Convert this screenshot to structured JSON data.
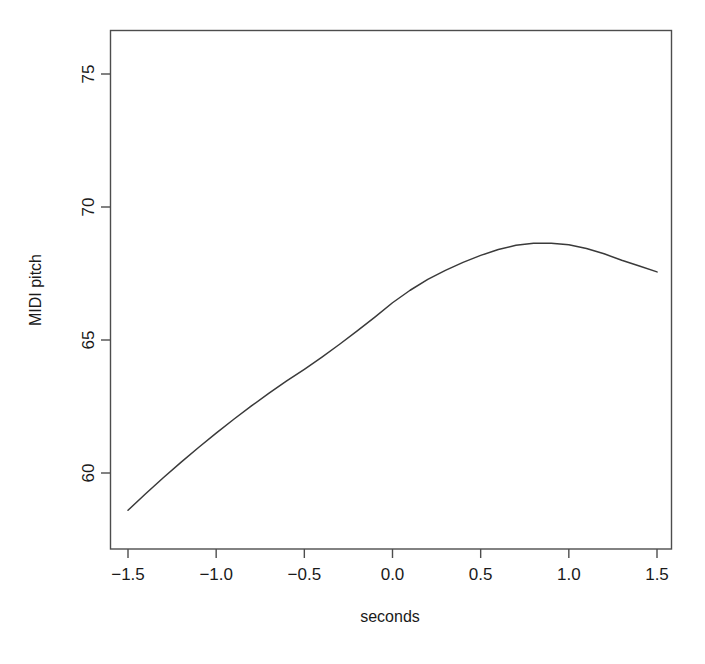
{
  "chart_data": {
    "type": "line",
    "title": "",
    "subtitle": "",
    "xlabel": "seconds",
    "ylabel": "MIDI pitch",
    "xlim": [
      -1.5,
      1.5
    ],
    "ylim": [
      57.6,
      76.4
    ],
    "grid": false,
    "legend": null,
    "legend_position": "none",
    "xticks": [
      -1.5,
      -1.0,
      -0.5,
      0.0,
      0.5,
      1.0,
      1.5
    ],
    "xtick_labels": [
      "-1.5",
      "-1.0",
      "-0.5",
      "0.0",
      "0.5",
      "1.0",
      "1.5"
    ],
    "yticks": [
      60,
      65,
      70,
      75
    ],
    "ytick_labels": [
      "60",
      "65",
      "70",
      "75"
    ],
    "series": [
      {
        "name": "smoothed pitch contour",
        "color": "#3a3a3a",
        "x": [
          -1.5,
          -1.4,
          -1.3,
          -1.2,
          -1.1,
          -1.0,
          -0.9,
          -0.8,
          -0.7,
          -0.6,
          -0.5,
          -0.4,
          -0.3,
          -0.2,
          -0.1,
          0.0,
          0.1,
          0.2,
          0.3,
          0.4,
          0.5,
          0.6,
          0.7,
          0.8,
          0.9,
          1.0,
          1.1,
          1.2,
          1.3,
          1.4,
          1.5
        ],
        "y": [
          58.6,
          59.22,
          59.82,
          60.4,
          60.96,
          61.5,
          62.02,
          62.52,
          63.0,
          63.46,
          63.9,
          64.36,
          64.84,
          65.34,
          65.86,
          66.4,
          66.87,
          67.28,
          67.62,
          67.92,
          68.18,
          68.4,
          68.56,
          68.64,
          68.64,
          68.58,
          68.44,
          68.24,
          68.0,
          67.78,
          67.56
        ]
      }
    ],
    "annotations": []
  },
  "axes": {
    "x_title": "seconds",
    "y_title": "MIDI pitch"
  }
}
